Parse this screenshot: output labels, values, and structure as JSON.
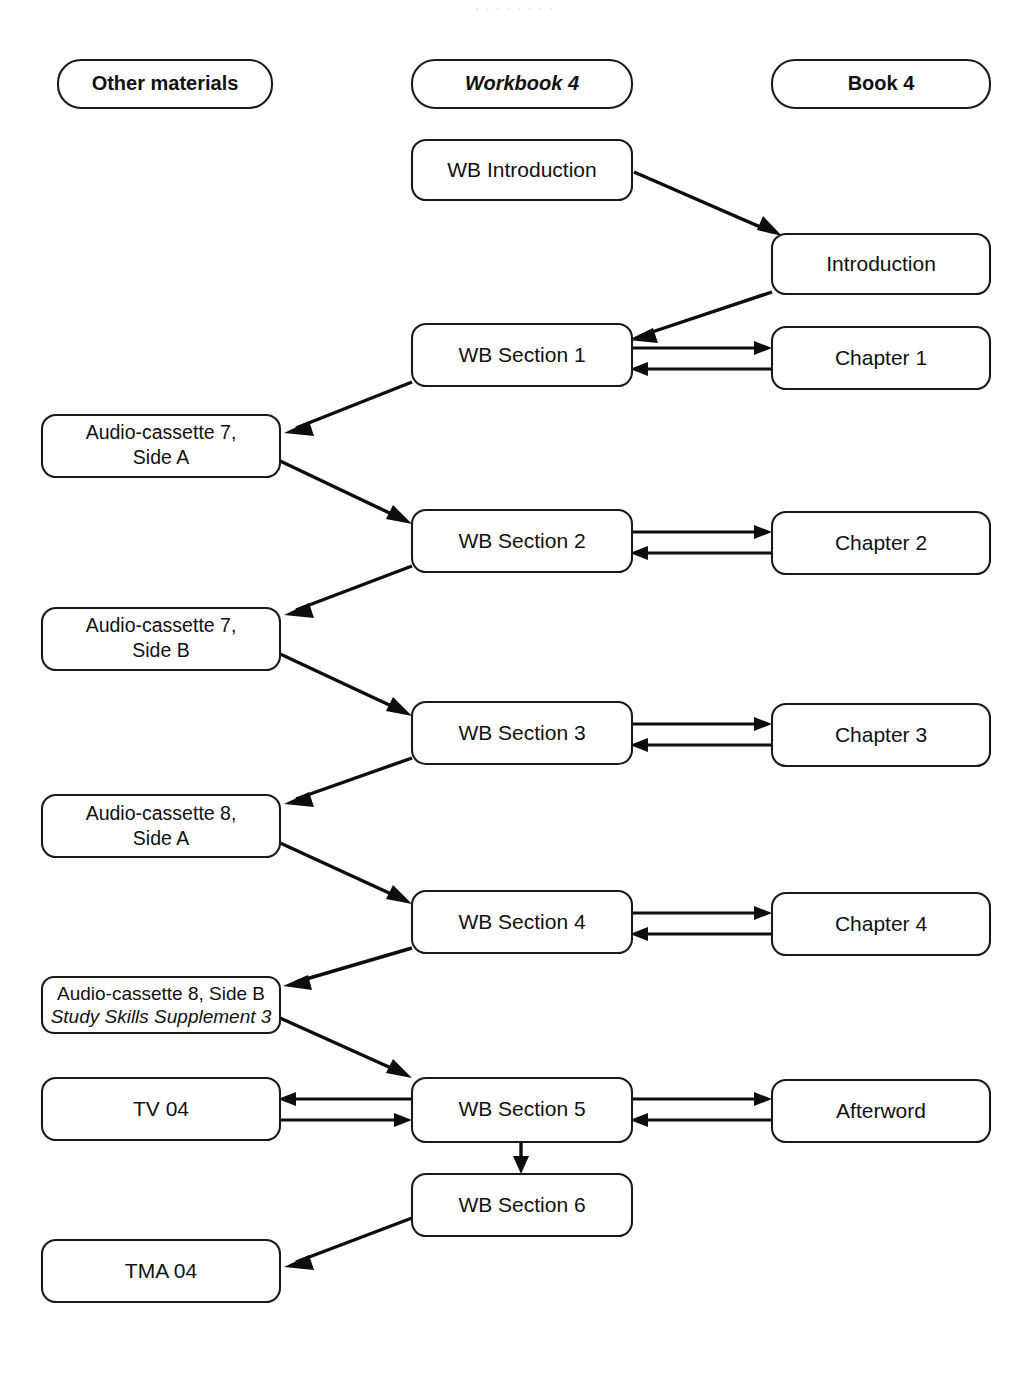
{
  "page": {
    "background_color": "#ffffff",
    "line_color": "#0d0d0d",
    "box_fill": "#ffffff",
    "box_stroke": "#1a1a1a"
  },
  "columns": {
    "other_materials": {
      "label": "Other materials"
    },
    "workbook": {
      "label": "Workbook 4"
    },
    "book": {
      "label": "Book 4"
    }
  },
  "nodes": {
    "wb_introduction": {
      "label": "WB Introduction"
    },
    "introduction": {
      "label": "Introduction"
    },
    "wb_section_1": {
      "label": "WB Section 1"
    },
    "chapter_1": {
      "label": "Chapter 1"
    },
    "cassette_7a": {
      "line1": "Audio-cassette 7,",
      "line2": "Side A"
    },
    "wb_section_2": {
      "label": "WB Section 2"
    },
    "chapter_2": {
      "label": "Chapter 2"
    },
    "cassette_7b": {
      "line1": "Audio-cassette 7,",
      "line2": "Side B"
    },
    "wb_section_3": {
      "label": "WB Section 3"
    },
    "chapter_3": {
      "label": "Chapter 3"
    },
    "cassette_8a": {
      "line1": "Audio-cassette 8,",
      "line2": "Side A"
    },
    "wb_section_4": {
      "label": "WB Section 4"
    },
    "chapter_4": {
      "label": "Chapter 4"
    },
    "cassette_8b": {
      "line1": "Audio-cassette 8, Side B",
      "line2": "Study Skills Supplement 3"
    },
    "tv_04": {
      "label": "TV 04"
    },
    "wb_section_5": {
      "label": "WB Section 5"
    },
    "afterword": {
      "label": "Afterword"
    },
    "wb_section_6": {
      "label": "WB Section 6"
    },
    "tma_04": {
      "label": "TMA 04"
    }
  },
  "edges": [
    {
      "from": "wb_introduction",
      "to": "introduction",
      "kind": "diagonal"
    },
    {
      "from": "introduction",
      "to": "wb_section_1",
      "kind": "diagonal"
    },
    {
      "from": "wb_section_1",
      "to": "chapter_1",
      "kind": "bidirectional"
    },
    {
      "from": "wb_section_1",
      "to": "cassette_7a",
      "kind": "diagonal"
    },
    {
      "from": "cassette_7a",
      "to": "wb_section_2",
      "kind": "diagonal"
    },
    {
      "from": "wb_section_2",
      "to": "chapter_2",
      "kind": "bidirectional"
    },
    {
      "from": "wb_section_2",
      "to": "cassette_7b",
      "kind": "diagonal"
    },
    {
      "from": "cassette_7b",
      "to": "wb_section_3",
      "kind": "diagonal"
    },
    {
      "from": "wb_section_3",
      "to": "chapter_3",
      "kind": "bidirectional"
    },
    {
      "from": "wb_section_3",
      "to": "cassette_8a",
      "kind": "diagonal"
    },
    {
      "from": "cassette_8a",
      "to": "wb_section_4",
      "kind": "diagonal"
    },
    {
      "from": "wb_section_4",
      "to": "chapter_4",
      "kind": "bidirectional"
    },
    {
      "from": "wb_section_4",
      "to": "cassette_8b",
      "kind": "diagonal"
    },
    {
      "from": "cassette_8b",
      "to": "wb_section_5",
      "kind": "diagonal"
    },
    {
      "from": "tv_04",
      "to": "wb_section_5",
      "kind": "bidirectional"
    },
    {
      "from": "wb_section_5",
      "to": "afterword",
      "kind": "bidirectional"
    },
    {
      "from": "wb_section_5",
      "to": "wb_section_6",
      "kind": "vertical"
    },
    {
      "from": "wb_section_6",
      "to": "tma_04",
      "kind": "diagonal"
    }
  ]
}
